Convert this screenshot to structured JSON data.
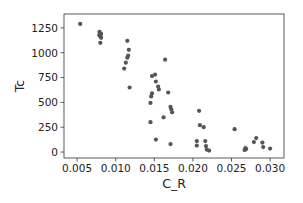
{
  "chart_data": {
    "type": "scatter",
    "title": "",
    "xlabel": "C_R",
    "ylabel": "Tc",
    "xlim": [
      0.0033,
      0.0318
    ],
    "ylim": [
      -60,
      1390
    ],
    "grid": false,
    "legend": null,
    "xticks": [
      0.005,
      0.01,
      0.015,
      0.02,
      0.025,
      0.03
    ],
    "xtick_labels": [
      "0.005",
      "0.010",
      "0.015",
      "0.020",
      "0.025",
      "0.030"
    ],
    "yticks": [
      0,
      250,
      500,
      750,
      1000,
      1250
    ],
    "ytick_labels": [
      "0",
      "250",
      "500",
      "750",
      "1000",
      "1250"
    ],
    "marker_color": "#555555",
    "series": [
      {
        "name": "Tc vs C_R",
        "points": [
          [
            0.0054,
            1290
          ],
          [
            0.0079,
            1210
          ],
          [
            0.008,
            1195
          ],
          [
            0.0079,
            1180
          ],
          [
            0.008,
            1165
          ],
          [
            0.0081,
            1150
          ],
          [
            0.0079,
            1175
          ],
          [
            0.0081,
            1190
          ],
          [
            0.008,
            1100
          ],
          [
            0.0115,
            1120
          ],
          [
            0.0117,
            1030
          ],
          [
            0.0116,
            970
          ],
          [
            0.0115,
            950
          ],
          [
            0.0113,
            900
          ],
          [
            0.0111,
            840
          ],
          [
            0.0118,
            650
          ],
          [
            0.0164,
            930
          ],
          [
            0.0147,
            765
          ],
          [
            0.0151,
            780
          ],
          [
            0.0152,
            710
          ],
          [
            0.0155,
            660
          ],
          [
            0.0156,
            630
          ],
          [
            0.0147,
            590
          ],
          [
            0.0146,
            560
          ],
          [
            0.0168,
            600
          ],
          [
            0.0145,
            495
          ],
          [
            0.0171,
            455
          ],
          [
            0.0172,
            430
          ],
          [
            0.0173,
            400
          ],
          [
            0.0162,
            350
          ],
          [
            0.0145,
            300
          ],
          [
            0.0152,
            125
          ],
          [
            0.0171,
            80
          ],
          [
            0.0208,
            415
          ],
          [
            0.0209,
            270
          ],
          [
            0.0214,
            250
          ],
          [
            0.0205,
            110
          ],
          [
            0.0205,
            65
          ],
          [
            0.0216,
            110
          ],
          [
            0.0217,
            60
          ],
          [
            0.0218,
            25
          ],
          [
            0.0221,
            15
          ],
          [
            0.0254,
            230
          ],
          [
            0.0268,
            40
          ],
          [
            0.0269,
            30
          ],
          [
            0.0267,
            20
          ],
          [
            0.0279,
            100
          ],
          [
            0.0282,
            140
          ],
          [
            0.029,
            95
          ],
          [
            0.0291,
            50
          ],
          [
            0.03,
            35
          ]
        ]
      }
    ]
  }
}
